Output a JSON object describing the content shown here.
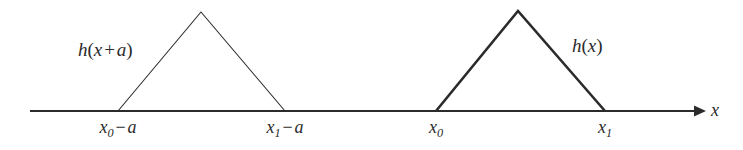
{
  "figure": {
    "background_color": "#ffffff",
    "ink_color": "#2b2b2b",
    "axis": {
      "label": "x",
      "arrow_direction": "right",
      "start_x": 30,
      "end_x": 700,
      "baseline_y": 111
    },
    "curves": [
      {
        "name": "shifted-triangle",
        "label": "h(x + a)",
        "label_parts": {
          "fn": "h",
          "open": "(",
          "var": "x",
          "op": "+",
          "shift": "a",
          "close": ")"
        },
        "stroke_width": 1.1,
        "left_x": 118,
        "apex_x": 201,
        "right_x": 285,
        "apex_y": 12
      },
      {
        "name": "base-triangle",
        "label": "h(x)",
        "label_parts": {
          "fn": "h",
          "open": "(",
          "var": "x",
          "close": ")"
        },
        "stroke_width": 2.6,
        "left_x": 436,
        "apex_x": 518,
        "right_x": 605,
        "apex_y": 11
      }
    ],
    "tick_labels": [
      {
        "name": "tick-x0-minus-a",
        "text": "x0 - a",
        "base": "x",
        "subscript": "0",
        "op": "−",
        "term": "a",
        "x": 118
      },
      {
        "name": "tick-x1-minus-a",
        "text": "x1 - a",
        "base": "x",
        "subscript": "1",
        "op": "−",
        "term": "a",
        "x": 285
      },
      {
        "name": "tick-x0",
        "text": "x0",
        "base": "x",
        "subscript": "0",
        "op": "",
        "term": "",
        "x": 436
      },
      {
        "name": "tick-x1",
        "text": "x1",
        "base": "x",
        "subscript": "1",
        "op": "",
        "term": "",
        "x": 605
      }
    ],
    "function_labels": [
      {
        "name": "label-h-x-plus-a",
        "x": 78,
        "y": 40
      },
      {
        "name": "label-h-x",
        "x": 572,
        "y": 36
      }
    ]
  }
}
